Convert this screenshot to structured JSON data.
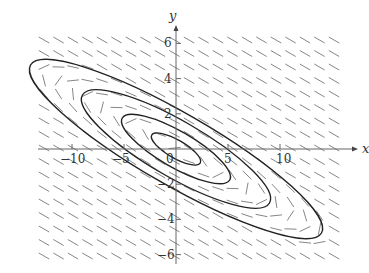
{
  "chart_data": {
    "type": "direction_field",
    "title": "",
    "xlabel": "x",
    "ylabel": "y",
    "xlim": [
      -14,
      17
    ],
    "ylim": [
      -7,
      7
    ],
    "x_ticks": [
      -10,
      -5,
      0,
      5,
      10
    ],
    "y_ticks": [
      -6,
      -4,
      -2,
      2,
      4,
      6
    ],
    "x_tick_labels": [
      "−10",
      "−5",
      "0",
      "5",
      "10"
    ],
    "y_tick_labels": [
      "−6",
      "−4",
      "−2",
      "2",
      "4",
      "6"
    ],
    "grid": false,
    "legend": null,
    "field_region": {
      "x": [
        -13,
        15
      ],
      "y": [
        -6,
        6
      ]
    },
    "trajectories": [
      {
        "name": "orbit-1",
        "shape": "ellipse",
        "center": [
          0,
          0
        ],
        "semi_major_px": 28,
        "semi_minor_px": 9,
        "angle_deg": 30
      },
      {
        "name": "orbit-2",
        "shape": "ellipse",
        "center": [
          0,
          0
        ],
        "semi_major_px": 62,
        "semi_minor_px": 18,
        "angle_deg": 30
      },
      {
        "name": "orbit-3",
        "shape": "ellipse",
        "center": [
          0,
          0
        ],
        "semi_major_px": 108,
        "semi_minor_px": 28,
        "angle_deg": 30
      },
      {
        "name": "orbit-4",
        "shape": "ellipse",
        "center": [
          0,
          0
        ],
        "semi_major_px": 168,
        "semi_minor_px": 36,
        "angle_deg": 30
      }
    ],
    "colors": {
      "axis": "#555555",
      "curve": "#222222",
      "field": "#666666"
    }
  }
}
